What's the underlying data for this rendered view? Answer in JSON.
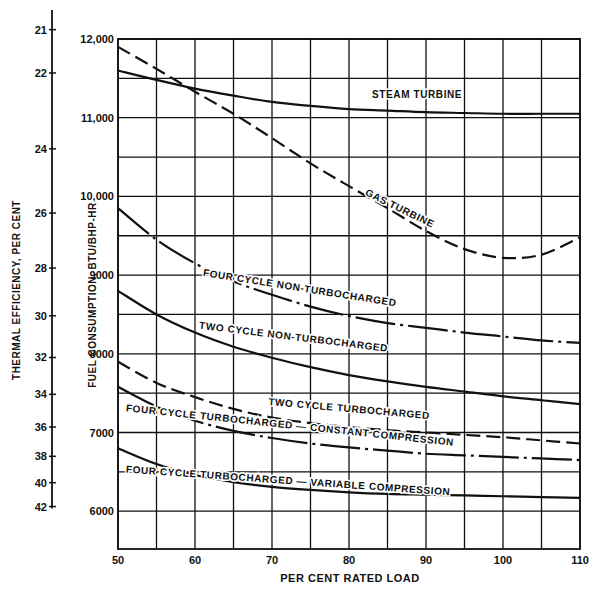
{
  "chart_data": {
    "type": "line",
    "title": "",
    "xlabel": "PER CENT RATED LOAD",
    "ylabel": "FUEL CONSUMPTION, BTU/BHP-HR",
    "ylabel_secondary": "THERMAL EFFICIENCY, PER CENT",
    "xlim": [
      50,
      110
    ],
    "ylim": [
      5500,
      12000
    ],
    "grid": true,
    "x_ticks": [
      50,
      60,
      70,
      80,
      90,
      100,
      110
    ],
    "x_tick_labels": [
      "50",
      "60",
      "70",
      "80",
      "90",
      "100",
      "110"
    ],
    "y_ticks": [
      6000,
      7000,
      8000,
      9000,
      10000,
      11000,
      12000
    ],
    "y_tick_labels": [
      "6000",
      "7000",
      "8000",
      "9000",
      "10,000",
      "11,000",
      "12,000"
    ],
    "secondary_axis_ticks": [
      {
        "label": "21",
        "value": 21
      },
      {
        "label": "22",
        "value": 22
      },
      {
        "label": "24",
        "value": 24
      },
      {
        "label": "26",
        "value": 26
      },
      {
        "label": "28",
        "value": 28
      },
      {
        "label": "30",
        "value": 30
      },
      {
        "label": "32",
        "value": 32
      },
      {
        "label": "34",
        "value": 34
      },
      {
        "label": "36",
        "value": 36
      },
      {
        "label": "38",
        "value": 38
      },
      {
        "label": "40",
        "value": 40
      },
      {
        "label": "42",
        "value": 42
      }
    ],
    "x": [
      50,
      55,
      60,
      65,
      70,
      75,
      80,
      85,
      90,
      95,
      100,
      105,
      110
    ],
    "series": [
      {
        "name": "STEAM TURBINE",
        "style": "solid",
        "values": [
          11600,
          11480,
          11370,
          11280,
          11200,
          11150,
          11110,
          11090,
          11070,
          11060,
          11050,
          11050,
          11050
        ]
      },
      {
        "name": "GAS TURBINE",
        "style": "dashed",
        "values": [
          11900,
          11620,
          11330,
          11050,
          10740,
          10420,
          10130,
          9850,
          9560,
          9330,
          9220,
          9260,
          9480
        ]
      },
      {
        "name": "FOUR CYCLE NON-TURBOCHARGED",
        "style": "dash-dot",
        "values": [
          9850,
          9450,
          9150,
          8920,
          8750,
          8600,
          8480,
          8390,
          8330,
          8270,
          8220,
          8170,
          8140
        ]
      },
      {
        "name": "TWO CYCLE NON-TURBOCHARGED",
        "style": "solid",
        "values": [
          8800,
          8500,
          8270,
          8090,
          7950,
          7830,
          7730,
          7650,
          7580,
          7520,
          7460,
          7410,
          7360
        ]
      },
      {
        "name": "TWO CYCLE TURBOCHARGED",
        "style": "dashed",
        "values": [
          7900,
          7630,
          7450,
          7300,
          7190,
          7120,
          7070,
          7030,
          7000,
          6970,
          6940,
          6900,
          6860
        ]
      },
      {
        "name": "FOUR CYCLE TURBOCHARGED — CONSTANT COMPRESSION",
        "style": "dash-dot",
        "values": [
          7580,
          7330,
          7150,
          7020,
          6930,
          6860,
          6810,
          6770,
          6730,
          6710,
          6690,
          6670,
          6650
        ]
      },
      {
        "name": "FOUR CYCLE TURBOCHARGED — VARIABLE COMPRESSION",
        "style": "solid",
        "values": [
          6800,
          6600,
          6460,
          6370,
          6310,
          6270,
          6240,
          6220,
          6210,
          6200,
          6190,
          6180,
          6170
        ]
      }
    ],
    "annotations": [
      {
        "text": "STEAM TURBINE",
        "x": 83,
        "y": 11250,
        "rotate": 0
      },
      {
        "text": "GAS TURBINE",
        "x": 82,
        "y": 10020,
        "rotate": 26
      },
      {
        "text": "FOUR CYCLE NON-TURBOCHARGED",
        "x": 61,
        "y": 8990,
        "rotate": 9
      },
      {
        "text": "TWO CYCLE NON-TURBOCHARGED",
        "x": 60.5,
        "y": 8320,
        "rotate": 7
      },
      {
        "text": "TWO CYCLE TURBOCHARGED",
        "x": 69.5,
        "y": 7350,
        "rotate": 5
      },
      {
        "text": "FOUR CYCLE TURBOCHARGED — CONSTANT COMPRESSION",
        "x": 51,
        "y": 7270,
        "rotate": 6
      },
      {
        "text": "FOUR CYCLE TURBOCHARGED — VARIABLE COMPRESSION",
        "x": 51,
        "y": 6490,
        "rotate": 4
      }
    ]
  },
  "caption": "Fig. 3. Fuel consumption and thermal efficiency of prime movers at various loads"
}
